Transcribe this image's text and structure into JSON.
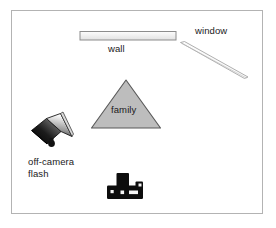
{
  "diagram": {
    "background_color": "#ffffff",
    "frame": {
      "name": "room-boundary",
      "stroke_color": "#b3b3b3",
      "x": 11,
      "y": 10,
      "width": 252,
      "height": 204
    },
    "labels": {
      "window": "window",
      "wall": "wall",
      "family": "family",
      "off_camera_flash_line1": "off-camera",
      "off_camera_flash_line2": "flash"
    },
    "shapes": {
      "wall": {
        "name": "wall-rectangle",
        "x": 80,
        "y": 31,
        "width": 97,
        "height": 9,
        "fill_color": "#f0f0f0",
        "stroke_color": "#8c8c8c"
      },
      "window": {
        "name": "window-diagonal-bar",
        "from_x": 180,
        "from_y": 43,
        "to_x": 248,
        "to_y": 78,
        "fill_color": "#fafafa",
        "stroke_color": "#9a9a9a"
      },
      "family": {
        "name": "family-triangle",
        "apex_x": 126,
        "apex_y": 80,
        "left_x": 92,
        "left_y": 128,
        "right_x": 160,
        "right_y": 128,
        "fill_color": "#bdbdbd",
        "stroke_color": "#555555"
      },
      "flash": {
        "name": "off-camera-flash-unit",
        "x": 30,
        "y": 110,
        "width": 45,
        "height": 40,
        "body_color": "#111111",
        "head_color": "#e8e8e8"
      },
      "camera": {
        "name": "camera-silhouette",
        "x": 107,
        "y": 174,
        "width": 37,
        "height": 28,
        "fill_color": "#0d0d0d"
      }
    }
  }
}
